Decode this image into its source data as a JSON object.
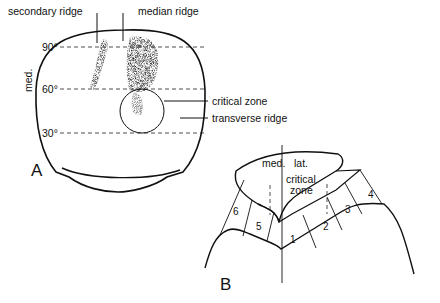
{
  "panel_a": {
    "label": "A",
    "axis_label": "med.",
    "angles": [
      "90°",
      "60°",
      "30°"
    ],
    "callouts": {
      "secondary_ridge": "secondary ridge",
      "median_ridge": "median ridge",
      "critical_zone": "critical zone",
      "transverse_ridge": "transverse ridge"
    }
  },
  "panel_b": {
    "label": "B",
    "side_labels": {
      "medial": "med.",
      "lateral": "lat."
    },
    "critical_zone_line1": "critical",
    "critical_zone_line2": "zone",
    "zones": [
      "1",
      "2",
      "3",
      "4",
      "5",
      "6"
    ]
  }
}
